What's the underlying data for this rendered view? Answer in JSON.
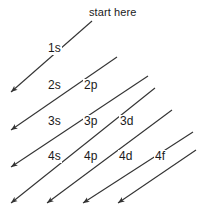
{
  "diagram": {
    "start_label": "start here",
    "stroke_color": "#333333",
    "background_color": "#ffffff",
    "arrow_count": 7,
    "orbitals": [
      {
        "id": "1s",
        "label": "1s",
        "x": 47,
        "y": 42,
        "n": 1,
        "sublevel": "s",
        "row": 1,
        "col": 1
      },
      {
        "id": "2s",
        "label": "2s",
        "x": 47,
        "y": 79,
        "n": 2,
        "sublevel": "s",
        "row": 2,
        "col": 1
      },
      {
        "id": "2p",
        "label": "2p",
        "x": 83,
        "y": 79,
        "n": 2,
        "sublevel": "p",
        "row": 2,
        "col": 2
      },
      {
        "id": "3s",
        "label": "3s",
        "x": 47,
        "y": 115,
        "n": 3,
        "sublevel": "s",
        "row": 3,
        "col": 1
      },
      {
        "id": "3p",
        "label": "3p",
        "x": 83,
        "y": 115,
        "n": 3,
        "sublevel": "p",
        "row": 3,
        "col": 2
      },
      {
        "id": "3d",
        "label": "3d",
        "x": 119,
        "y": 115,
        "n": 3,
        "sublevel": "d",
        "row": 3,
        "col": 3
      },
      {
        "id": "4s",
        "label": "4s",
        "x": 47,
        "y": 150,
        "n": 4,
        "sublevel": "s",
        "row": 4,
        "col": 1
      },
      {
        "id": "4p",
        "label": "4p",
        "x": 83,
        "y": 150,
        "n": 4,
        "sublevel": "p",
        "row": 4,
        "col": 2
      },
      {
        "id": "4d",
        "label": "4d",
        "x": 118,
        "y": 150,
        "n": 4,
        "sublevel": "d",
        "row": 4,
        "col": 3
      },
      {
        "id": "4f",
        "label": "4f",
        "x": 154,
        "y": 150,
        "n": 4,
        "sublevel": "f",
        "row": 4,
        "col": 4
      }
    ],
    "arrows": [
      {
        "id": "arrow-1",
        "x1": 92,
        "y1": 21,
        "x2": 11,
        "y2": 92,
        "covers": "1s"
      },
      {
        "id": "arrow-2",
        "x1": 117,
        "y1": 57,
        "x2": 11,
        "y2": 130,
        "covers": "2s"
      },
      {
        "id": "arrow-3",
        "x1": 148,
        "y1": 76,
        "x2": 11,
        "y2": 167,
        "covers": "2p 3s"
      },
      {
        "id": "arrow-4",
        "x1": 155,
        "y1": 88,
        "x2": 11,
        "y2": 203,
        "covers": "3p 4s"
      },
      {
        "id": "arrow-5",
        "x1": 172,
        "y1": 110,
        "x2": 47,
        "y2": 203,
        "covers": "3d 4p"
      },
      {
        "id": "arrow-6",
        "x1": 193,
        "y1": 132,
        "x2": 83,
        "y2": 203,
        "covers": "4d"
      },
      {
        "id": "arrow-7",
        "x1": 196,
        "y1": 150,
        "x2": 118,
        "y2": 203,
        "covers": "4f"
      }
    ],
    "start_label_pos": {
      "x": 89,
      "y": 6
    }
  }
}
